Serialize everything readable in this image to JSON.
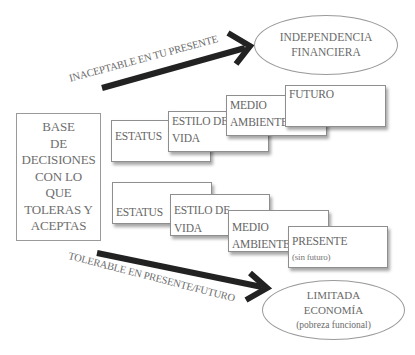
{
  "diagram": {
    "base_box": {
      "lines": [
        "BASE",
        "DE",
        "DECISIONES",
        "CON LO",
        "QUE",
        "TOLERAS Y",
        "ACEPTAS"
      ]
    },
    "top_row": {
      "cards": [
        {
          "lines": [
            "ESTATUS"
          ]
        },
        {
          "lines": [
            "ESTILO DE",
            "VIDA"
          ]
        },
        {
          "lines": [
            "MEDIO",
            "AMBIENTE"
          ]
        },
        {
          "lines": [
            "FUTURO"
          ]
        }
      ]
    },
    "bottom_row": {
      "cards": [
        {
          "lines": [
            "ESTATUS"
          ]
        },
        {
          "lines": [
            "ESTILO DE",
            "VIDA"
          ]
        },
        {
          "lines": [
            "MEDIO",
            "AMBIENTE"
          ]
        },
        {
          "lines": [
            "PRESENTE"
          ],
          "sub": "(sin futuro)"
        }
      ]
    },
    "top_arrow": {
      "label": "INACEPTABLE EN TU PRESENTE"
    },
    "bottom_arrow": {
      "label": "TOLERABLE EN PRESENTE/FUTURO"
    },
    "top_outcome": {
      "lines": [
        "INDEPENDENCIA",
        "FINANCIERA"
      ]
    },
    "bottom_outcome": {
      "lines": [
        "LIMITADA",
        "ECONOMÍA"
      ],
      "sub": "(pobreza funcional)"
    },
    "colors": {
      "text": "#6a6a6a",
      "border": "#8e8e8e",
      "arrow": "#222222",
      "background": "#ffffff"
    }
  }
}
